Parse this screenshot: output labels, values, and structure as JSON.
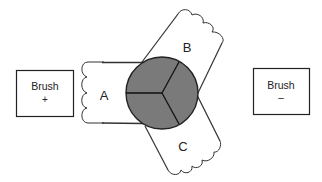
{
  "diagram": {
    "type": "three-coil armature with brushes",
    "brush_left": {
      "label": "Brush",
      "sign": "+"
    },
    "brush_right": {
      "label": "Brush",
      "sign": "–"
    },
    "coils": [
      {
        "id": "A",
        "label": "A"
      },
      {
        "id": "B",
        "label": "B"
      },
      {
        "id": "C",
        "label": "C"
      }
    ],
    "commutator": {
      "segments": 3,
      "fill": "#7a7a7a"
    },
    "colors": {
      "stroke": "#222222",
      "background": "#ffffff"
    }
  }
}
